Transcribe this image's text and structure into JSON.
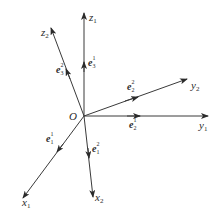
{
  "diagram": {
    "line_color": "#3a3a3a",
    "origin": {
      "label": "O",
      "x": 84,
      "y": 116
    },
    "frames": [
      {
        "name": "frame-1",
        "axes": [
          {
            "id": "x1",
            "base": "x",
            "sub": "1",
            "end": [
              23,
              198
            ],
            "vector": {
              "base": "e",
              "sup": "1",
              "sub": "1",
              "pos": [
                50,
                140
              ]
            }
          },
          {
            "id": "y1",
            "base": "y",
            "sub": "1",
            "end": [
              208,
              116
            ],
            "vector": {
              "base": "e",
              "sup": "1",
              "sub": "2",
              "pos": [
                132,
                126
              ]
            }
          },
          {
            "id": "z1",
            "base": "z",
            "sub": "1",
            "end": [
              84,
              13
            ],
            "vector": {
              "base": "e",
              "sup": "1",
              "sub": "3",
              "pos": [
                88,
                64
              ]
            }
          }
        ]
      },
      {
        "name": "frame-2",
        "axes": [
          {
            "id": "x2",
            "base": "x",
            "sub": "2",
            "end": [
              93,
              197
            ],
            "vector": {
              "base": "e",
              "sup": "2",
              "sub": "1",
              "pos": [
                92,
                150
              ]
            }
          },
          {
            "id": "y2",
            "base": "y",
            "sub": "2",
            "end": [
              187,
              79
            ],
            "vector": {
              "base": "e",
              "sup": "2",
              "sub": "2",
              "pos": [
                130,
                87
              ]
            }
          },
          {
            "id": "z2",
            "base": "z",
            "sub": "2",
            "end": [
              51,
              28
            ],
            "vector": {
              "base": "e",
              "sup": "2",
              "sub": "3",
              "pos": [
                60,
                69
              ]
            }
          }
        ]
      }
    ],
    "labels": {
      "origin": "O",
      "x1": {
        "base": "x",
        "sub": "1"
      },
      "x2": {
        "base": "x",
        "sub": "2"
      },
      "y1": {
        "base": "y",
        "sub": "1"
      },
      "y2": {
        "base": "y",
        "sub": "2"
      },
      "z1": {
        "base": "z",
        "sub": "1"
      },
      "z2": {
        "base": "z",
        "sub": "2"
      },
      "e1_1": {
        "base": "e",
        "sup": "1",
        "sub": "1"
      },
      "e1_2": {
        "base": "e",
        "sup": "2",
        "sub": "1"
      },
      "e2_1": {
        "base": "e",
        "sup": "1",
        "sub": "2"
      },
      "e2_2": {
        "base": "e",
        "sup": "2",
        "sub": "2"
      },
      "e3_1": {
        "base": "e",
        "sup": "1",
        "sub": "3"
      },
      "e3_2": {
        "base": "e",
        "sup": "2",
        "sub": "3"
      }
    }
  }
}
